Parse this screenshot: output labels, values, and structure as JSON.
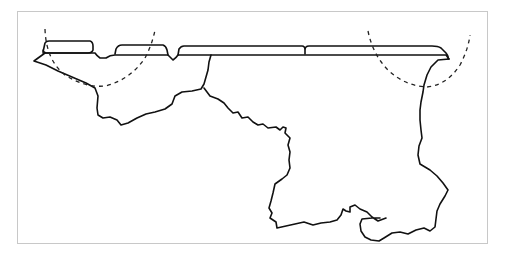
{
  "figure": {
    "type": "outline-map",
    "colors": {
      "line": "#111111",
      "background": "#ffffff",
      "frame": "#c8c8c8"
    },
    "elements": {
      "dashed_arcs": 2,
      "top_band_segments": 5
    }
  }
}
